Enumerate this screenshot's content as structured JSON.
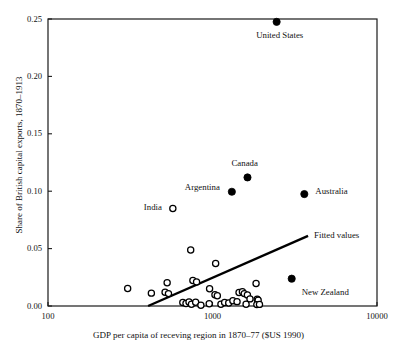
{
  "chart_data": {
    "type": "scatter",
    "title": "",
    "xlabel": "GDP per capita of receving region in 1870–77 ($US 1990)",
    "ylabel": "Share of British capital exports, 1870–1913",
    "xscale": "log",
    "yscale": "linear",
    "xlim": [
      100,
      10000
    ],
    "ylim": [
      0.0,
      0.25
    ],
    "xticks": [
      100,
      1000,
      10000
    ],
    "xtick_labels": [
      "100",
      "1000",
      "10000"
    ],
    "yticks": [
      0.0,
      0.05,
      0.1,
      0.15,
      0.2,
      0.25
    ],
    "ytick_labels": [
      "0.00",
      "0.05",
      "0.10",
      "0.15",
      "0.20",
      "0.25"
    ],
    "grid": false,
    "legend": "none",
    "frame": "box",
    "series": [
      {
        "name": "Labelled regions",
        "marker": "filled-circle",
        "color": "#000000",
        "points": [
          {
            "label": "United States",
            "x": 2454,
            "y": 0.2475,
            "label_dx": 3,
            "label_dy": 14,
            "label_anchor": "middle"
          },
          {
            "label": "Canada",
            "x": 1632,
            "y": 0.112,
            "label_dx": -3,
            "label_dy": -14,
            "label_anchor": "middle"
          },
          {
            "label": "Argentina",
            "x": 1311,
            "y": 0.0995,
            "label_dx": -12,
            "label_dy": -4,
            "label_anchor": "end"
          },
          {
            "label": "Australia",
            "x": 3616,
            "y": 0.0975,
            "label_dx": 11,
            "label_dy": -3,
            "label_anchor": "start"
          },
          {
            "label": "New Zealand",
            "x": 3030,
            "y": 0.0238,
            "label_dx": 10,
            "label_dy": 14,
            "label_anchor": "start"
          }
        ]
      },
      {
        "name": "Other regions",
        "marker": "open-circle",
        "color": "#000000",
        "points": [
          {
            "label": "India",
            "x": 574,
            "y": 0.085,
            "label_dx": -11,
            "label_dy": -1,
            "label_anchor": "end"
          },
          {
            "label": "",
            "x": 737,
            "y": 0.0487
          },
          {
            "label": "",
            "x": 1045,
            "y": 0.037
          },
          {
            "label": "",
            "x": 305,
            "y": 0.0153
          },
          {
            "label": "",
            "x": 530,
            "y": 0.0202
          },
          {
            "label": "",
            "x": 760,
            "y": 0.0222
          },
          {
            "label": "",
            "x": 800,
            "y": 0.021
          },
          {
            "label": "",
            "x": 1840,
            "y": 0.0196
          },
          {
            "label": "",
            "x": 425,
            "y": 0.0112
          },
          {
            "label": "",
            "x": 515,
            "y": 0.012
          },
          {
            "label": "",
            "x": 540,
            "y": 0.0108
          },
          {
            "label": "",
            "x": 960,
            "y": 0.015
          },
          {
            "label": "",
            "x": 1035,
            "y": 0.0098
          },
          {
            "label": "",
            "x": 1070,
            "y": 0.009
          },
          {
            "label": "",
            "x": 1450,
            "y": 0.0118
          },
          {
            "label": "",
            "x": 1520,
            "y": 0.0125
          },
          {
            "label": "",
            "x": 1560,
            "y": 0.0108
          },
          {
            "label": "",
            "x": 1630,
            "y": 0.0095
          },
          {
            "label": "",
            "x": 1690,
            "y": 0.0062
          },
          {
            "label": "",
            "x": 1870,
            "y": 0.0058
          },
          {
            "label": "",
            "x": 1895,
            "y": 0.005
          },
          {
            "label": "",
            "x": 660,
            "y": 0.003
          },
          {
            "label": "",
            "x": 690,
            "y": 0.0021
          },
          {
            "label": "",
            "x": 720,
            "y": 0.0035
          },
          {
            "label": "",
            "x": 745,
            "y": 0.0015
          },
          {
            "label": "",
            "x": 790,
            "y": 0.0032
          },
          {
            "label": "",
            "x": 850,
            "y": 0.0006
          },
          {
            "label": "",
            "x": 955,
            "y": 0.002
          },
          {
            "label": "",
            "x": 1125,
            "y": 0.0015
          },
          {
            "label": "",
            "x": 1185,
            "y": 0.003
          },
          {
            "label": "",
            "x": 1255,
            "y": 0.0026
          },
          {
            "label": "",
            "x": 1330,
            "y": 0.0046
          },
          {
            "label": "",
            "x": 1410,
            "y": 0.0038
          },
          {
            "label": "",
            "x": 1600,
            "y": 0.0015
          },
          {
            "label": "",
            "x": 1860,
            "y": 0.0012
          },
          {
            "label": "",
            "x": 1930,
            "y": 0.0014
          }
        ]
      }
    ],
    "fit_line": {
      "name": "Fitted values",
      "label": "Fitted values",
      "style": "solid",
      "color": "#000000",
      "width": 2.4,
      "x_start": 406,
      "y_start": 0.0,
      "x_end": 3810,
      "y_end": 0.061,
      "label_dx": 6,
      "label_dy": 0
    }
  },
  "labels": {
    "fitted_values": "Fitted values",
    "united_states": "United States",
    "canada": "Canada",
    "argentina": "Argentina",
    "australia": "Australia",
    "new_zealand": "New Zealand",
    "india": "India"
  }
}
